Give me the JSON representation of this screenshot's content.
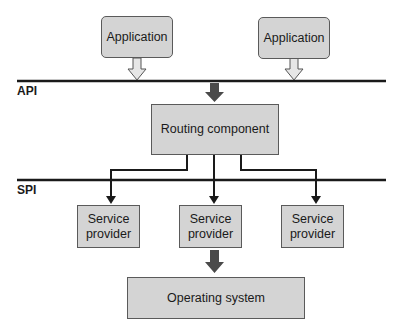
{
  "diagram": {
    "layers": {
      "api_label": "API",
      "spi_label": "SPI"
    },
    "applications": [
      {
        "label": "Application"
      },
      {
        "label": "Application"
      }
    ],
    "routing": {
      "label": "Routing component"
    },
    "service_providers": [
      {
        "line1": "Service",
        "line2": "provider"
      },
      {
        "line1": "Service",
        "line2": "provider"
      },
      {
        "line1": "Service",
        "line2": "provider"
      }
    ],
    "os": {
      "label": "Operating system"
    },
    "colors": {
      "box_fill": "#d4d4d4",
      "box_border": "#5a5a5a",
      "line": "#1a1a1a",
      "block_arrow": "#4a4a4a"
    }
  }
}
